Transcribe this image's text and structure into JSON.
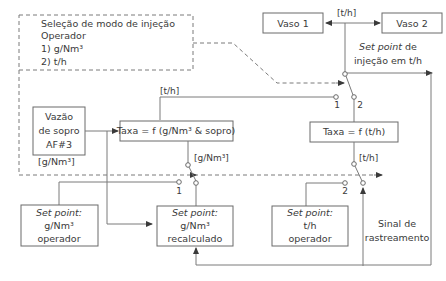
{
  "diagram": {
    "mode_selection": {
      "title": "Seleção de modo de injeção",
      "line2": "Operador",
      "option1": "1) g/Nm³",
      "option2": "2) t/h"
    },
    "vessel1": "Vaso 1",
    "vessel2": "Vaso 2",
    "top_unit": "[t/h]",
    "setpoint_injection": {
      "line1_italic": "Set point",
      "line1_rest": " de",
      "line2": "injeção em t/h"
    },
    "blow_flow": {
      "line1": "Vazão",
      "line2": "de sopro",
      "line3": "AF#3",
      "unit": "[g/Nm³]"
    },
    "rate_g": "Taxa = f (g/Nm³ & sopro)",
    "rate_t": "Taxa = f (t/h)",
    "unit_th_mid": "[t/h]",
    "unit_gnm3_mid": "[g/Nm³]",
    "unit_th_right": "[t/h]",
    "switch_labels": {
      "top_1": "1",
      "top_2": "2",
      "left_1": "1",
      "right_2": "2"
    },
    "sp_gnm3_operator": {
      "line1": "Set point:",
      "line2": "g/Nm³",
      "line3": "operador"
    },
    "sp_gnm3_recalc": {
      "line1": "Set point:",
      "line2": "g/Nm³",
      "line3": "recalculado"
    },
    "sp_th_operator": {
      "line1": "Set point:",
      "line2": "t/h",
      "line3": "operador"
    },
    "tracking_signal": {
      "line1": "Sinal de",
      "line2": "rastreamento"
    }
  }
}
